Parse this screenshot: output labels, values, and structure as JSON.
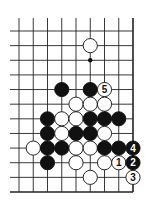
{
  "diagram": {
    "board": {
      "columns": 9,
      "rows": 12,
      "edges": {
        "top": "open",
        "left": "open",
        "right": "closed",
        "bottom": "closed"
      }
    },
    "colors": {
      "black": "#111111",
      "white": "#ffffff",
      "line": "#222222"
    },
    "marks": [
      {
        "col": 5,
        "row": 2,
        "type": "dot"
      }
    ],
    "stones": [
      {
        "col": 5,
        "row": 1,
        "color": "white"
      },
      {
        "col": 3,
        "row": 4,
        "color": "black"
      },
      {
        "col": 5,
        "row": 4,
        "color": "black"
      },
      {
        "col": 6,
        "row": 4,
        "color": "white",
        "label": "5"
      },
      {
        "col": 4,
        "row": 5,
        "color": "white"
      },
      {
        "col": 5,
        "row": 5,
        "color": "white"
      },
      {
        "col": 6,
        "row": 5,
        "color": "white"
      },
      {
        "col": 2,
        "row": 6,
        "color": "black"
      },
      {
        "col": 3,
        "row": 6,
        "color": "white"
      },
      {
        "col": 4,
        "row": 6,
        "color": "white"
      },
      {
        "col": 5,
        "row": 6,
        "color": "black"
      },
      {
        "col": 6,
        "row": 6,
        "color": "black"
      },
      {
        "col": 7,
        "row": 6,
        "color": "black"
      },
      {
        "col": 2,
        "row": 7,
        "color": "black"
      },
      {
        "col": 3,
        "row": 7,
        "color": "white"
      },
      {
        "col": 4,
        "row": 7,
        "color": "black"
      },
      {
        "col": 5,
        "row": 7,
        "color": "black"
      },
      {
        "col": 6,
        "row": 7,
        "color": "white"
      },
      {
        "col": 1,
        "row": 8,
        "color": "white"
      },
      {
        "col": 2,
        "row": 8,
        "color": "black"
      },
      {
        "col": 3,
        "row": 8,
        "color": "black"
      },
      {
        "col": 4,
        "row": 8,
        "color": "white"
      },
      {
        "col": 5,
        "row": 8,
        "color": "white"
      },
      {
        "col": 6,
        "row": 8,
        "color": "black"
      },
      {
        "col": 7,
        "row": 8,
        "color": "black"
      },
      {
        "col": 8,
        "row": 8,
        "color": "black",
        "label": "4"
      },
      {
        "col": 2,
        "row": 9,
        "color": "black"
      },
      {
        "col": 4,
        "row": 9,
        "color": "white"
      },
      {
        "col": 6,
        "row": 9,
        "color": "white"
      },
      {
        "col": 7,
        "row": 9,
        "color": "white",
        "label": "1"
      },
      {
        "col": 8,
        "row": 9,
        "color": "black",
        "label": "2"
      },
      {
        "col": 5,
        "row": 10,
        "color": "white"
      },
      {
        "col": 8,
        "row": 10,
        "color": "white",
        "label": "3"
      }
    ]
  }
}
